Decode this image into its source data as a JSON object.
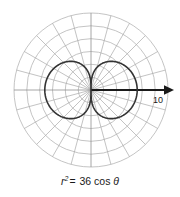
{
  "figure": {
    "background_color": "#ffffff",
    "width": 180,
    "height": 197
  },
  "caption": {
    "full_text": "r 2 = 36 cos θ",
    "variable": "r",
    "exponent": "2",
    "equals": "=",
    "coefficient": "36",
    "function": "cos",
    "angle": "θ"
  },
  "axis": {
    "label": "10",
    "arrow_name": "polar-axis-arrow",
    "color": "#1a1a1a"
  },
  "chart_data": {
    "type": "line",
    "plot_style": "polar",
    "title": "",
    "subtitle": "",
    "xlabel": "",
    "ylabel": "",
    "equation": "r^2 = 36 cos(theta)",
    "curve_name": "lemniscate",
    "curve_color": "#333333",
    "grid": {
      "visible": true,
      "color": "#a9a9a9",
      "radial_circles": 6,
      "radial_circle_values": [
        1.667,
        3.333,
        5.0,
        6.667,
        8.333,
        10.0
      ],
      "angular_rays": 24,
      "angular_step_degrees": 15,
      "max_radius_value": 10
    },
    "axes": {
      "polar_axis_length_value": 11,
      "polar_axis_tick_label": "10",
      "rlim": [
        0,
        10
      ]
    },
    "series": [
      {
        "name": "r^2 = 36 cos(theta)",
        "max_r": 6,
        "theta_range_degrees": [
          -90,
          90
        ],
        "lobes": 2,
        "points_polar": [
          {
            "theta_deg": 0,
            "r": 6.0
          },
          {
            "theta_deg": 10,
            "r": 5.954
          },
          {
            "theta_deg": 20,
            "r": 5.814
          },
          {
            "theta_deg": 30,
            "r": 5.568
          },
          {
            "theta_deg": 40,
            "r": 5.19
          },
          {
            "theta_deg": 50,
            "r": 4.63
          },
          {
            "theta_deg": 60,
            "r": 3.78
          },
          {
            "theta_deg": 70,
            "r": 2.76
          },
          {
            "theta_deg": 80,
            "r": 1.58
          },
          {
            "theta_deg": 85,
            "r": 0.79
          },
          {
            "theta_deg": 90,
            "r": 0.0
          }
        ]
      }
    ],
    "legend": {
      "visible": false,
      "position": "none"
    },
    "annotations": [
      {
        "text": "10",
        "role": "axis-tick-label"
      }
    ]
  }
}
